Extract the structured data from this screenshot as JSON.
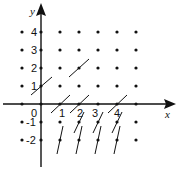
{
  "diagram": {
    "type": "slope-field",
    "axes": {
      "x_label": "x",
      "y_label": "y",
      "origin_label": "0",
      "x_ticks": [
        "1",
        "2",
        "3",
        "4"
      ],
      "y_ticks": [
        "4",
        "3",
        "2",
        "1",
        "-1",
        "-2"
      ]
    },
    "grid": {
      "x_values": [
        -1,
        0,
        1,
        2,
        3,
        4,
        5
      ],
      "y_values": [
        4,
        3,
        2,
        1,
        0,
        -1,
        -2
      ]
    },
    "segments": [
      {
        "x": 0,
        "y": 1,
        "slope": "positive-shallow"
      },
      {
        "x": 2,
        "y": 2,
        "slope": "positive-shallow"
      },
      {
        "x": 1,
        "y": 0,
        "slope": "positive-shallow"
      },
      {
        "x": 2,
        "y": 0,
        "slope": "positive-shallow"
      },
      {
        "x": 4,
        "y": 0,
        "slope": "positive-shallow"
      },
      {
        "x": 2,
        "y": -1,
        "slope": "positive-steep"
      },
      {
        "x": 3,
        "y": -1,
        "slope": "positive-steep"
      },
      {
        "x": 4,
        "y": -1,
        "slope": "positive-steep"
      },
      {
        "x": 1,
        "y": -2,
        "slope": "positive-steep"
      },
      {
        "x": 2,
        "y": -2,
        "slope": "positive-steep"
      },
      {
        "x": 3,
        "y": -2,
        "slope": "positive-steep"
      },
      {
        "x": 4,
        "y": -2,
        "slope": "positive-steep"
      }
    ],
    "colors": {
      "ink": "#111111",
      "background": "#ffffff"
    }
  }
}
